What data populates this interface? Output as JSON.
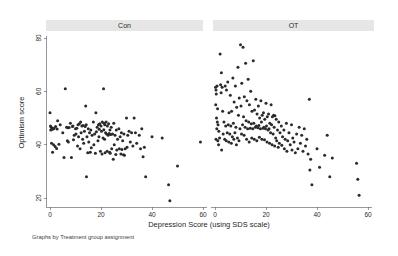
{
  "figure": {
    "background_color": "#ffffff",
    "marker_color": "#2a2a2a",
    "strip_color": "#e6e6e6",
    "axis_color": "#6e6e6e",
    "footnote": "Graphs by Treatment group assignment"
  },
  "chart_data": {
    "type": "scatter",
    "title": "",
    "xlabel": "Depression Score (using SDS scale)",
    "ylabel": "Optimism score",
    "xlim": [
      -2,
      63
    ],
    "ylim": [
      17,
      82
    ],
    "xticks": [
      0,
      20,
      40,
      60
    ],
    "yticks": [
      20,
      40,
      60,
      80
    ],
    "grid": false,
    "legend": "none",
    "facet_by": "Treatment group assignment",
    "panels": [
      {
        "label": "Con",
        "points": [
          [
            0,
            52.0
          ],
          [
            0.5,
            46.5
          ],
          [
            0.8,
            46.0
          ],
          [
            1.0,
            45.8
          ],
          [
            1.2,
            46.2
          ],
          [
            0.3,
            45.5
          ],
          [
            0.6,
            40.5
          ],
          [
            1.4,
            40.0
          ],
          [
            2.0,
            39.3
          ],
          [
            2.6,
            38.6
          ],
          [
            1.0,
            37.2
          ],
          [
            3.0,
            49.0
          ],
          [
            4.0,
            47.5
          ],
          [
            5.0,
            44.5
          ],
          [
            5.5,
            35.2
          ],
          [
            6.0,
            61.0
          ],
          [
            6.5,
            46.5
          ],
          [
            7.0,
            46.3
          ],
          [
            7.5,
            46.4
          ],
          [
            6.8,
            41.5
          ],
          [
            7.2,
            41.0
          ],
          [
            8.0,
            48.0
          ],
          [
            8.4,
            35.2
          ],
          [
            9.0,
            47.0
          ],
          [
            9.5,
            43.5
          ],
          [
            9.2,
            41.8
          ],
          [
            10.0,
            46.0
          ],
          [
            10.5,
            46.2
          ],
          [
            10.2,
            44.0
          ],
          [
            10.8,
            39.5
          ],
          [
            11.0,
            47.5
          ],
          [
            11.5,
            47.8
          ],
          [
            11.2,
            43.0
          ],
          [
            11.8,
            38.5
          ],
          [
            12.0,
            48.5
          ],
          [
            12.5,
            47.0
          ],
          [
            12.2,
            44.5
          ],
          [
            12.8,
            42.0
          ],
          [
            13.0,
            47.2
          ],
          [
            13.5,
            45.0
          ],
          [
            13.2,
            40.5
          ],
          [
            14.0,
            54.5
          ],
          [
            14.2,
            47.5
          ],
          [
            14.5,
            43.0
          ],
          [
            14.8,
            37.0
          ],
          [
            14.3,
            28.0
          ],
          [
            15.0,
            46.0
          ],
          [
            15.5,
            44.5
          ],
          [
            15.2,
            41.0
          ],
          [
            15.8,
            37.2
          ],
          [
            16.0,
            45.5
          ],
          [
            16.5,
            43.5
          ],
          [
            16.2,
            38.8
          ],
          [
            17.0,
            48.5
          ],
          [
            17.5,
            44.0
          ],
          [
            17.2,
            40.0
          ],
          [
            17.8,
            36.8
          ],
          [
            18.0,
            52.0
          ],
          [
            18.5,
            46.5
          ],
          [
            18.2,
            44.8
          ],
          [
            18.8,
            41.5
          ],
          [
            19.0,
            47.5
          ],
          [
            19.5,
            47.8
          ],
          [
            19.2,
            43.0
          ],
          [
            19.8,
            37.5
          ],
          [
            20.0,
            47.0
          ],
          [
            20.5,
            48.5
          ],
          [
            20.2,
            45.0
          ],
          [
            20.8,
            42.5
          ],
          [
            20.4,
            36.5
          ],
          [
            21.0,
            61.0
          ],
          [
            21.2,
            48.0
          ],
          [
            21.5,
            47.5
          ],
          [
            21.8,
            44.5
          ],
          [
            21.4,
            42.0
          ],
          [
            21.6,
            37.0
          ],
          [
            22.0,
            48.5
          ],
          [
            22.5,
            47.0
          ],
          [
            22.2,
            44.0
          ],
          [
            22.8,
            43.5
          ],
          [
            22.4,
            37.5
          ],
          [
            23.0,
            47.8
          ],
          [
            23.5,
            45.5
          ],
          [
            23.2,
            44.2
          ],
          [
            23.8,
            43.8
          ],
          [
            23.4,
            37.2
          ],
          [
            23.6,
            36.8
          ],
          [
            24.0,
            46.5
          ],
          [
            24.5,
            44.0
          ],
          [
            24.2,
            38.5
          ],
          [
            24.8,
            34.5
          ],
          [
            25.0,
            48.0
          ],
          [
            25.5,
            43.5
          ],
          [
            25.2,
            40.0
          ],
          [
            26.0,
            45.5
          ],
          [
            26.5,
            42.0
          ],
          [
            26.2,
            38.0
          ],
          [
            27.0,
            46.0
          ],
          [
            27.5,
            43.0
          ],
          [
            27.2,
            38.5
          ],
          [
            27.8,
            36.5
          ],
          [
            28.0,
            44.5
          ],
          [
            28.5,
            41.5
          ],
          [
            28.2,
            38.2
          ],
          [
            28.8,
            36.2
          ],
          [
            29.0,
            44.0
          ],
          [
            29.5,
            38.5
          ],
          [
            29.2,
            36.0
          ],
          [
            30.0,
            50.0
          ],
          [
            30.5,
            43.5
          ],
          [
            30.2,
            39.0
          ],
          [
            31.0,
            45.0
          ],
          [
            31.5,
            41.0
          ],
          [
            32.0,
            44.5
          ],
          [
            32.5,
            39.5
          ],
          [
            33.0,
            50.0
          ],
          [
            33.5,
            44.5
          ],
          [
            34.0,
            40.5
          ],
          [
            35.0,
            43.5
          ],
          [
            35.5,
            38.5
          ],
          [
            36.0,
            46.0
          ],
          [
            36.5,
            35.5
          ],
          [
            37.0,
            39.0
          ],
          [
            37.5,
            28.0
          ],
          [
            40.0,
            43.0
          ],
          [
            44.0,
            42.5
          ],
          [
            46.5,
            25.0
          ],
          [
            47.0,
            19.0
          ],
          [
            50.0,
            32.0
          ],
          [
            59.0,
            41.0
          ],
          [
            2.2,
            46.8
          ],
          [
            2.8,
            45.9
          ],
          [
            1.6,
            46.1
          ],
          [
            0.2,
            47.0
          ],
          [
            3.5,
            40.2
          ],
          [
            8.8,
            46.8
          ],
          [
            13.8,
            46.8
          ],
          [
            19.3,
            45.8
          ],
          [
            21.1,
            45.6
          ],
          [
            25.8,
            36.3
          ]
        ]
      },
      {
        "label": "OT",
        "points": [
          [
            0.2,
            61.5
          ],
          [
            0.4,
            60.5
          ],
          [
            0.8,
            62.0
          ],
          [
            0.5,
            59.0
          ],
          [
            0.3,
            55.0
          ],
          [
            1.0,
            53.5
          ],
          [
            0.6,
            50.0
          ],
          [
            0.9,
            48.5
          ],
          [
            1.2,
            47.5
          ],
          [
            0.7,
            46.0
          ],
          [
            1.5,
            45.0
          ],
          [
            1.8,
            42.5
          ],
          [
            0.4,
            42.0
          ],
          [
            1.1,
            41.5
          ],
          [
            1.4,
            40.0
          ],
          [
            2.0,
            74.0
          ],
          [
            2.5,
            67.0
          ],
          [
            2.2,
            62.5
          ],
          [
            2.8,
            61.5
          ],
          [
            2.4,
            59.5
          ],
          [
            3.0,
            52.5
          ],
          [
            3.5,
            48.5
          ],
          [
            3.2,
            44.0
          ],
          [
            3.8,
            42.0
          ],
          [
            2.6,
            38.0
          ],
          [
            4.0,
            62.0
          ],
          [
            4.5,
            60.5
          ],
          [
            4.2,
            47.0
          ],
          [
            4.8,
            44.5
          ],
          [
            4.4,
            41.5
          ],
          [
            5.0,
            63.5
          ],
          [
            5.5,
            52.0
          ],
          [
            5.2,
            47.5
          ],
          [
            5.8,
            44.0
          ],
          [
            5.4,
            41.0
          ],
          [
            6.0,
            58.5
          ],
          [
            6.5,
            52.5
          ],
          [
            6.2,
            47.0
          ],
          [
            6.8,
            43.0
          ],
          [
            6.4,
            40.5
          ],
          [
            7.0,
            65.0
          ],
          [
            7.5,
            56.0
          ],
          [
            7.2,
            48.0
          ],
          [
            7.8,
            44.5
          ],
          [
            7.4,
            42.0
          ],
          [
            8.0,
            62.0
          ],
          [
            8.5,
            54.0
          ],
          [
            8.2,
            46.5
          ],
          [
            8.8,
            42.5
          ],
          [
            8.4,
            40.0
          ],
          [
            9.0,
            69.0
          ],
          [
            9.5,
            57.5
          ],
          [
            9.2,
            51.0
          ],
          [
            9.8,
            46.0
          ],
          [
            9.4,
            41.5
          ],
          [
            10.0,
            77.5
          ],
          [
            10.5,
            63.0
          ],
          [
            10.2,
            54.5
          ],
          [
            10.8,
            47.5
          ],
          [
            10.4,
            44.0
          ],
          [
            11.0,
            76.5
          ],
          [
            11.5,
            58.0
          ],
          [
            11.2,
            50.5
          ],
          [
            11.8,
            46.5
          ],
          [
            11.4,
            43.5
          ],
          [
            12.0,
            70.5
          ],
          [
            12.5,
            56.5
          ],
          [
            12.2,
            49.0
          ],
          [
            12.8,
            46.0
          ],
          [
            12.4,
            42.0
          ],
          [
            13.0,
            64.5
          ],
          [
            13.5,
            55.0
          ],
          [
            13.2,
            48.5
          ],
          [
            13.8,
            46.2
          ],
          [
            13.4,
            41.0
          ],
          [
            14.0,
            60.0
          ],
          [
            14.5,
            52.5
          ],
          [
            14.2,
            47.8
          ],
          [
            14.8,
            46.0
          ],
          [
            14.4,
            42.5
          ],
          [
            15.0,
            71.5
          ],
          [
            15.5,
            53.0
          ],
          [
            15.2,
            48.0
          ],
          [
            15.8,
            46.5
          ],
          [
            15.4,
            42.0
          ],
          [
            16.0,
            57.0
          ],
          [
            16.5,
            51.5
          ],
          [
            16.2,
            47.0
          ],
          [
            16.8,
            46.3
          ],
          [
            16.4,
            41.5
          ],
          [
            17.0,
            54.5
          ],
          [
            17.5,
            50.0
          ],
          [
            17.2,
            47.2
          ],
          [
            17.8,
            46.0
          ],
          [
            17.4,
            42.8
          ],
          [
            18.0,
            56.5
          ],
          [
            18.5,
            51.0
          ],
          [
            18.2,
            48.5
          ],
          [
            18.8,
            46.2
          ],
          [
            18.4,
            42.0
          ],
          [
            19.0,
            52.0
          ],
          [
            19.5,
            49.5
          ],
          [
            19.2,
            46.5
          ],
          [
            19.8,
            46.0
          ],
          [
            19.4,
            41.8
          ],
          [
            20.0,
            55.5
          ],
          [
            20.5,
            50.5
          ],
          [
            20.2,
            47.0
          ],
          [
            20.8,
            45.5
          ],
          [
            20.4,
            41.0
          ],
          [
            21.0,
            51.5
          ],
          [
            21.5,
            48.0
          ],
          [
            21.2,
            46.0
          ],
          [
            21.8,
            44.5
          ],
          [
            21.4,
            40.5
          ],
          [
            22.0,
            55.0
          ],
          [
            22.5,
            50.5
          ],
          [
            22.2,
            47.5
          ],
          [
            22.8,
            44.0
          ],
          [
            22.4,
            40.0
          ],
          [
            23.0,
            51.0
          ],
          [
            23.5,
            50.8
          ],
          [
            23.2,
            46.5
          ],
          [
            23.8,
            42.5
          ],
          [
            23.4,
            39.5
          ],
          [
            24.0,
            49.5
          ],
          [
            24.5,
            45.5
          ],
          [
            24.2,
            41.5
          ],
          [
            24.8,
            39.0
          ],
          [
            25.0,
            48.5
          ],
          [
            25.5,
            44.5
          ],
          [
            25.2,
            40.5
          ],
          [
            26.0,
            47.0
          ],
          [
            26.5,
            43.0
          ],
          [
            26.2,
            39.8
          ],
          [
            27.0,
            45.5
          ],
          [
            27.5,
            42.0
          ],
          [
            27.2,
            38.5
          ],
          [
            28.0,
            48.0
          ],
          [
            28.5,
            41.5
          ],
          [
            28.2,
            37.5
          ],
          [
            29.0,
            44.5
          ],
          [
            29.5,
            40.0
          ],
          [
            30.0,
            47.5
          ],
          [
            30.5,
            42.5
          ],
          [
            30.2,
            38.0
          ],
          [
            31.0,
            41.0
          ],
          [
            31.5,
            37.0
          ],
          [
            32.0,
            44.0
          ],
          [
            32.5,
            38.5
          ],
          [
            33.0,
            46.5
          ],
          [
            33.5,
            40.5
          ],
          [
            34.0,
            43.5
          ],
          [
            34.5,
            37.5
          ],
          [
            35.0,
            46.0
          ],
          [
            35.5,
            39.5
          ],
          [
            36.0,
            42.0
          ],
          [
            36.5,
            36.5
          ],
          [
            37.0,
            57.0
          ],
          [
            37.5,
            34.5
          ],
          [
            37.2,
            30.5
          ],
          [
            38.0,
            25.0
          ],
          [
            40.0,
            38.5
          ],
          [
            41.0,
            31.5
          ],
          [
            43.0,
            36.0
          ],
          [
            44.0,
            43.5
          ],
          [
            45.0,
            28.0
          ],
          [
            46.0,
            35.0
          ],
          [
            55.5,
            33.0
          ],
          [
            56.0,
            27.0
          ],
          [
            56.5,
            21.0
          ]
        ]
      }
    ]
  }
}
